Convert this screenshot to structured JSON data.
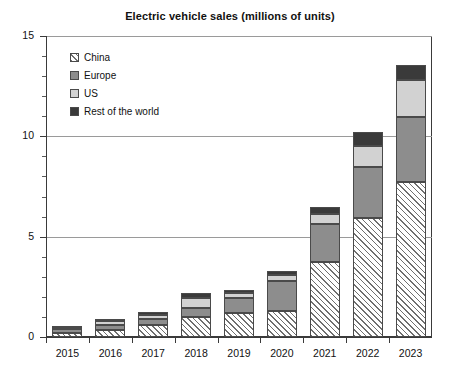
{
  "chart_data": {
    "type": "bar",
    "subtype": "stacked-vertical",
    "title": "Electric vehicle sales (millions of units)",
    "xlabel": "",
    "ylabel": "",
    "ylim": [
      0,
      15
    ],
    "yticks": [
      0,
      5,
      10,
      15
    ],
    "ytick_labels": [
      "0",
      "5",
      "10",
      "15"
    ],
    "yminor_step": 1,
    "grid": "horizontal-major",
    "legend_position": "top-left-inside",
    "categories": [
      "2015",
      "2016",
      "2017",
      "2018",
      "2019",
      "2020",
      "2021",
      "2022",
      "2023"
    ],
    "series": [
      {
        "name": "China",
        "pattern": "diagonal-hatch",
        "color": "#ffffff",
        "values": [
          0.2,
          0.35,
          0.6,
          1.0,
          1.2,
          1.3,
          3.75,
          5.95,
          7.7
        ]
      },
      {
        "name": "Europe",
        "pattern": "solid",
        "color": "#8d8d8d",
        "values": [
          0.2,
          0.25,
          0.3,
          0.45,
          0.75,
          1.5,
          1.9,
          2.5,
          3.25
        ]
      },
      {
        "name": "US",
        "pattern": "solid",
        "color": "#d2d2d2",
        "values": [
          0.12,
          0.18,
          0.22,
          0.5,
          0.25,
          0.3,
          0.5,
          1.05,
          1.85
        ]
      },
      {
        "name": "Rest of the world",
        "pattern": "solid",
        "color": "#3a3a3a",
        "values": [
          0.03,
          0.12,
          0.13,
          0.25,
          0.15,
          0.2,
          0.35,
          0.7,
          0.75
        ]
      }
    ],
    "totals": [
      0.55,
      0.9,
      1.25,
      2.2,
      2.35,
      3.3,
      6.5,
      10.2,
      13.55
    ]
  },
  "legend": {
    "entries": [
      {
        "label": "China"
      },
      {
        "label": "Europe"
      },
      {
        "label": "US"
      },
      {
        "label": "Rest of the world"
      }
    ]
  }
}
